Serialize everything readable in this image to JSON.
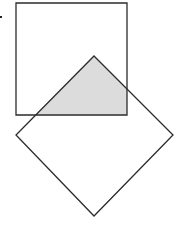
{
  "diagram": {
    "type": "geometric-overlap",
    "canvas": {
      "width": 177,
      "height": 231,
      "background": "#ffffff"
    },
    "stroke_color": "#2b2b2b",
    "fill_color": "#dcdcdc",
    "marker": {
      "x": 0,
      "y": 16,
      "w": 2,
      "h": 2,
      "color": "#222222"
    },
    "square": {
      "points": "16,3 127,3 127,115 16,115"
    },
    "diamond": {
      "points": "94,56 173,135 94,216 16,135"
    },
    "intersection": {
      "points": "94,56 127,89 127,115 36,115"
    }
  }
}
